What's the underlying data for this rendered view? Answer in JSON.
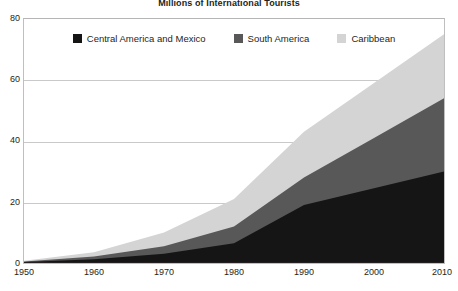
{
  "chart_data": {
    "type": "area",
    "stacked": true,
    "title": "Millions of International Tourists",
    "subtitle": "",
    "xlabel": "",
    "ylabel": "",
    "x": [
      1950,
      1960,
      1970,
      1980,
      1990,
      2000,
      2010
    ],
    "categories": [
      "1950",
      "1960",
      "1970",
      "1980",
      "1990",
      "2000",
      "2010"
    ],
    "xlim": [
      1950,
      2010
    ],
    "ylim": [
      0,
      80
    ],
    "yticks": [
      0,
      20,
      40,
      60,
      80
    ],
    "ytick_labels": [
      "0",
      "20",
      "40",
      "60",
      "80"
    ],
    "xticks": [
      1950,
      1960,
      1970,
      1980,
      1990,
      2000,
      2010
    ],
    "xtick_labels": [
      "1950",
      "1960",
      "1970",
      "1980",
      "1990",
      "2000",
      "2010"
    ],
    "grid": true,
    "grid_axis": "y",
    "legend": true,
    "legend_position": "top-center-inside",
    "series": [
      {
        "name": "Central America and Mexico",
        "color": "#151515",
        "values": [
          0.3,
          1.2,
          3.0,
          6.5,
          19.0,
          24.5,
          30.0
        ]
      },
      {
        "name": "South America",
        "color": "#585858",
        "values": [
          0.2,
          0.9,
          2.5,
          5.5,
          9.0,
          16.5,
          24.0
        ]
      },
      {
        "name": "Caribbean",
        "color": "#d4d4d4",
        "values": [
          0.2,
          1.4,
          4.5,
          9.0,
          15.0,
          18.0,
          21.0
        ]
      }
    ],
    "cumulative_tops": {
      "Central America and Mexico": [
        0.3,
        1.2,
        3.0,
        6.5,
        19.0,
        24.5,
        30.0
      ],
      "South America": [
        0.5,
        2.1,
        5.5,
        12.0,
        28.0,
        41.0,
        54.0
      ],
      "Caribbean": [
        0.7,
        3.5,
        10.0,
        21.0,
        43.0,
        59.0,
        75.0
      ]
    }
  },
  "legend": {
    "items": [
      {
        "label": "Central America and Mexico",
        "color": "#151515"
      },
      {
        "label": "South America",
        "color": "#585858"
      },
      {
        "label": "Caribbean",
        "color": "#d4d4d4"
      }
    ]
  },
  "axes": {
    "y_tick_labels": [
      "80",
      "60",
      "40",
      "20",
      "0"
    ],
    "x_tick_labels": [
      "1950",
      "1960",
      "1970",
      "1980",
      "1990",
      "2000",
      "2010"
    ]
  }
}
